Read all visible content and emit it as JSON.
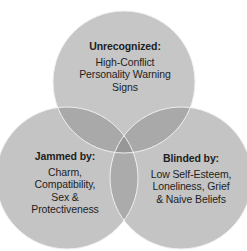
{
  "diagram": {
    "type": "venn",
    "circles": [
      {
        "id": "top",
        "title": "Unrecognized:",
        "lines": [
          "High-Conflict",
          "Personality Warning",
          "Signs"
        ]
      },
      {
        "id": "left",
        "title": "Jammed by:",
        "lines": [
          "Charm,",
          "Compatibility,",
          "Sex &",
          "Protectiveness"
        ]
      },
      {
        "id": "right",
        "title": "Blinded by:",
        "lines": [
          "Low Self-Esteem,",
          "Loneliness, Grief",
          "& Naive Beliefs"
        ]
      }
    ],
    "colors": {
      "circle_fill": "#c4c4c4",
      "overlap_fill": "#a8a8a8",
      "center_fill": "#959595",
      "outline": "#f2f2f2",
      "text": "#1e1e1e"
    }
  }
}
